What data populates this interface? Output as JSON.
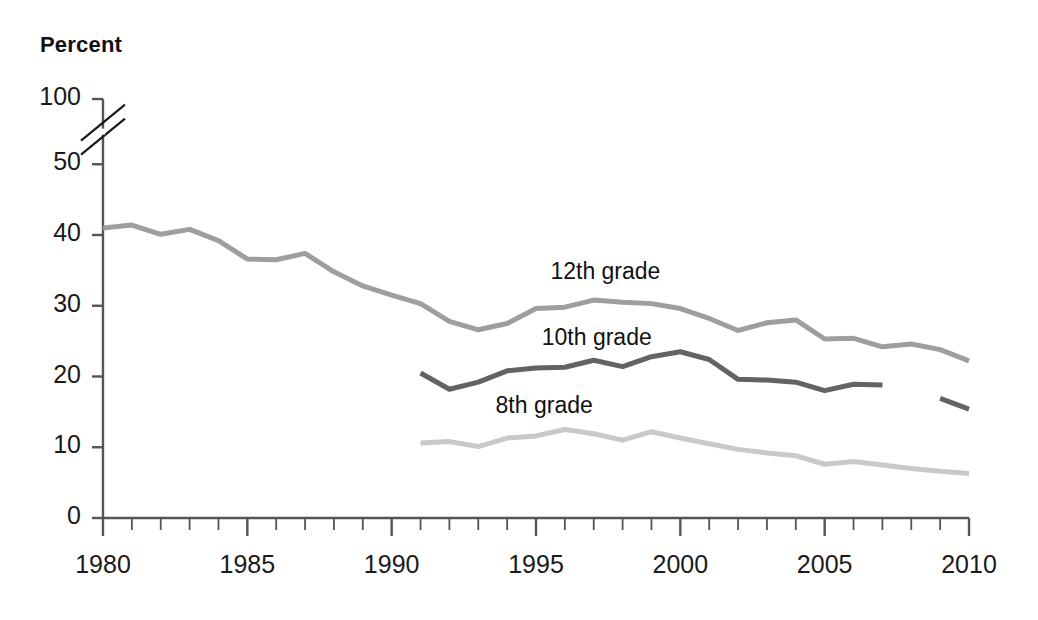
{
  "chart_data": {
    "type": "line",
    "title": "",
    "subtitle": "",
    "xlabel": "",
    "ylabel": "Percent",
    "xlim": [
      1980,
      2010
    ],
    "ylim": [
      0,
      50
    ],
    "axis_break": {
      "present": true,
      "between": [
        50,
        100
      ],
      "style": "double-slash"
    },
    "grid": false,
    "legend_position": "inline-labels",
    "y_ticks": [
      0,
      10,
      20,
      30,
      40,
      50,
      100
    ],
    "x_ticks": [
      1980,
      1985,
      1990,
      1995,
      2000,
      2005,
      2010
    ],
    "x_minor_tick_interval": 1,
    "series": [
      {
        "name": "12th grade",
        "color": "#9e9e9e",
        "label_x": 1995.5,
        "label_y": 34.5,
        "x": [
          1980,
          1981,
          1982,
          1983,
          1984,
          1985,
          1986,
          1987,
          1988,
          1989,
          1990,
          1991,
          1992,
          1993,
          1994,
          1995,
          1996,
          1997,
          1998,
          1999,
          2000,
          2001,
          2002,
          2003,
          2004,
          2005,
          2006,
          2007,
          2008,
          2009,
          2010
        ],
        "values": [
          41.0,
          41.4,
          40.1,
          40.8,
          39.2,
          36.6,
          36.5,
          37.4,
          34.8,
          32.8,
          31.5,
          30.3,
          27.8,
          26.6,
          27.5,
          29.6,
          29.8,
          30.8,
          30.5,
          30.3,
          29.6,
          28.2,
          26.5,
          27.6,
          28.0,
          25.3,
          25.4,
          24.2,
          24.6,
          23.8,
          22.2
        ]
      },
      {
        "name": "10th grade",
        "color": "#636363",
        "label_x": 1995.2,
        "label_y": 25.2,
        "x": [
          1991,
          1992,
          1993,
          1994,
          1995,
          1996,
          1997,
          1998,
          1999,
          2000,
          2001,
          2002,
          2003,
          2004,
          2005,
          2006,
          2007
        ],
        "values": [
          20.5,
          18.2,
          19.2,
          20.8,
          21.2,
          21.3,
          22.3,
          21.4,
          22.8,
          23.5,
          22.4,
          19.6,
          19.5,
          19.2,
          18.0,
          18.9,
          18.8
        ]
      },
      {
        "name": "10th grade (later segment)",
        "color": "#636363",
        "x": [
          2009,
          2010
        ],
        "values": [
          16.9,
          15.4
        ]
      },
      {
        "name": "8th grade",
        "color": "#c9c9c9",
        "label_x": 1993.6,
        "label_y": 15.6,
        "x": [
          1991,
          1992,
          1993,
          1994,
          1995,
          1996,
          1997,
          1998,
          1999,
          2000,
          2001,
          2002,
          2003,
          2004,
          2005,
          2006,
          2007,
          2008,
          2009,
          2010
        ],
        "values": [
          10.6,
          10.8,
          10.1,
          11.3,
          11.6,
          12.5,
          11.9,
          11.0,
          12.2,
          11.3,
          10.5,
          9.7,
          9.2,
          8.8,
          7.6,
          8.0,
          7.5,
          7.0,
          6.6,
          6.3
        ]
      }
    ]
  },
  "axes": {
    "y_title": "Percent",
    "y_tick_labels": [
      "100",
      "50",
      "40",
      "30",
      "20",
      "10",
      "0"
    ],
    "x_tick_labels": [
      "1980",
      "1985",
      "1990",
      "1995",
      "2000",
      "2005",
      "2010"
    ]
  },
  "labels": {
    "grade12": "12th grade",
    "grade10": "10th grade",
    "grade8": "8th grade"
  },
  "colors": {
    "grade12": "#9e9e9e",
    "grade10": "#636363",
    "grade8": "#c9c9c9",
    "axis": "#555555",
    "text": "#1a1a1a"
  }
}
